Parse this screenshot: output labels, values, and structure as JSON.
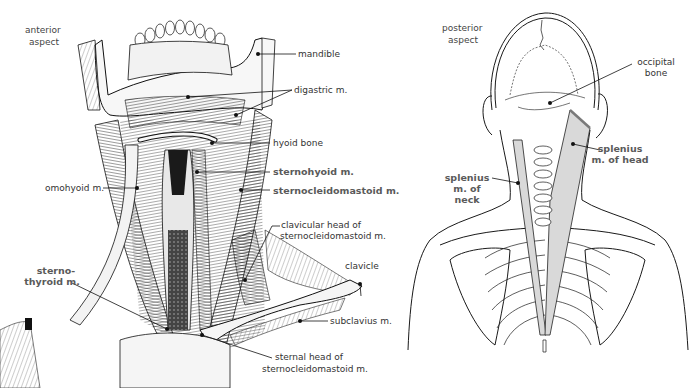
{
  "figure": {
    "type": "anatomical illustration",
    "colors": {
      "line": "#1a1a1a",
      "label_text": "#333333",
      "bold_label_text": "#5a5a5a",
      "splenius_shade": "#d9d9d9",
      "background": "#ffffff"
    }
  },
  "anterior": {
    "aspect_label": [
      "anterior",
      "aspect"
    ],
    "labels": {
      "mandible": "mandible",
      "digastric": "digastric m.",
      "hyoid": "hyoid bone",
      "sternohyoid": "sternohyoid m.",
      "sternocleidomastoid": "sternocleidomastoid m.",
      "omohyoid": "omohyoid m.",
      "clavicular_head": [
        "clavicular head of",
        "sternocleidomastoid m."
      ],
      "clavicle": "clavicle",
      "sternothyroid": [
        "sterno-",
        "thyroid m."
      ],
      "subclavius": "subclavius m.",
      "sternal_head": [
        "sternal head of",
        "sternocleidomastoid m."
      ]
    }
  },
  "posterior": {
    "aspect_label": [
      "posterior",
      "aspect"
    ],
    "labels": {
      "occipital": [
        "occipital",
        "bone"
      ],
      "splenius_head": [
        "splenius",
        "m. of head"
      ],
      "splenius_neck": [
        "splenius",
        "m. of",
        "neck"
      ]
    }
  }
}
